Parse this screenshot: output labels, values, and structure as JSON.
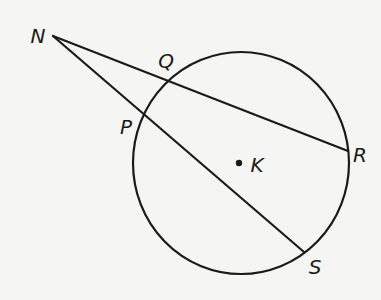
{
  "figure": {
    "type": "circle-with-secants",
    "circle": {
      "center_label": "K",
      "center": [
        241,
        163
      ],
      "rx": 108,
      "ry": 111
    },
    "points": [
      {
        "id": "N",
        "label": "N",
        "x": 53,
        "y": 36,
        "label_x": 38,
        "label_y": 36
      },
      {
        "id": "Q",
        "label": "Q",
        "x": 169,
        "y": 82,
        "label_x": 166,
        "label_y": 61
      },
      {
        "id": "P",
        "label": "P",
        "x": 144,
        "y": 117,
        "label_x": 126,
        "label_y": 127
      },
      {
        "id": "R",
        "label": "R",
        "x": 348,
        "y": 151,
        "label_x": 360,
        "label_y": 155
      },
      {
        "id": "S",
        "label": "S",
        "x": 304,
        "y": 252,
        "label_x": 315,
        "label_y": 267
      },
      {
        "id": "K",
        "label": "K",
        "x": 239,
        "y": 163,
        "label_x": 257,
        "label_y": 165
      }
    ],
    "segments": [
      {
        "name": "secant-NR",
        "from": "N",
        "to": "R"
      },
      {
        "name": "secant-NS",
        "from": "N",
        "to": "S"
      }
    ],
    "stroke_color": "#1a1a1a"
  },
  "labels": {
    "N": "N",
    "Q": "Q",
    "P": "P",
    "R": "R",
    "S": "S",
    "K": "K"
  }
}
